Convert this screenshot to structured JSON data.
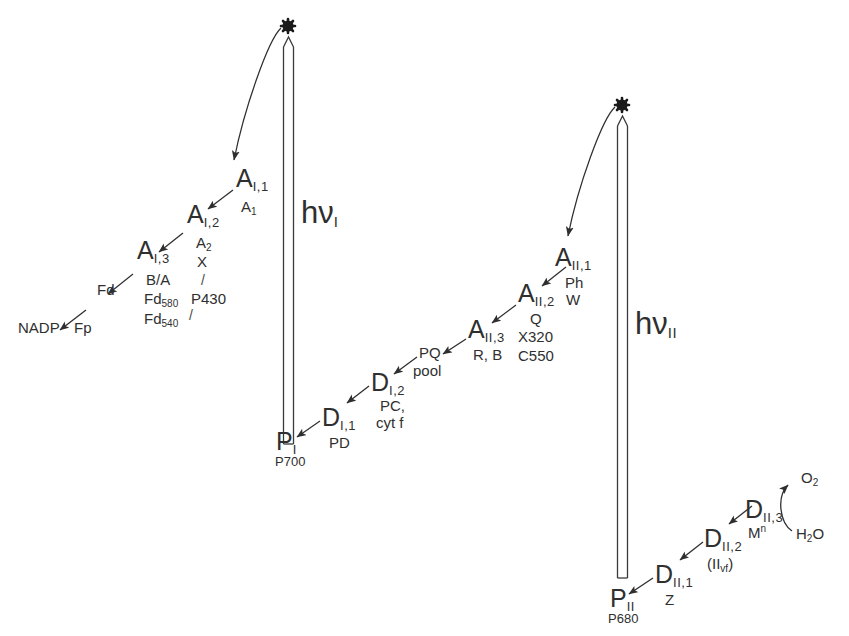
{
  "diagram": {
    "background": "#ffffff",
    "ink": "#2f2f2f"
  },
  "photosystem_I": {
    "photon_label": "hν",
    "photon_subscript": "I",
    "excited_state_marker": "✻",
    "reaction_center": {
      "symbol": "P",
      "subscript": "I",
      "alias": "P700"
    },
    "acceptors": [
      {
        "symbol": "A",
        "subscript": "I,1",
        "aliases": [
          "A₁"
        ]
      },
      {
        "symbol": "A",
        "subscript": "I,2",
        "aliases": [
          "A₂",
          "X",
          "/",
          "P430"
        ]
      },
      {
        "symbol": "A",
        "subscript": "I,3",
        "aliases": [
          "B/A",
          "Fd₅₈₀",
          "Fd₅₄₀"
        ]
      }
    ],
    "acceptor_alias_column1": [
      "A₂",
      "X",
      "B/A",
      "Fd₅₈₀",
      "Fd₅₄₀"
    ],
    "acceptor_alias_column2": [
      "A₁",
      "/",
      "P430"
    ],
    "terminal_carriers": [
      {
        "label": "Fd"
      },
      {
        "label": "Fp"
      },
      {
        "label": "NADP"
      }
    ],
    "donors": [
      {
        "symbol": "D",
        "subscript": "I,1",
        "aliases": [
          "PD"
        ]
      },
      {
        "symbol": "D",
        "subscript": "I,2",
        "aliases": [
          "PC,",
          "cyt f"
        ]
      }
    ]
  },
  "photosystem_II": {
    "photon_label": "hν",
    "photon_subscript": "II",
    "excited_state_marker": "✻",
    "reaction_center": {
      "symbol": "P",
      "subscript": "II",
      "alias": "P680"
    },
    "acceptors": [
      {
        "symbol": "A",
        "subscript": "II,1",
        "aliases": [
          "Ph",
          "W"
        ]
      },
      {
        "symbol": "A",
        "subscript": "II,2",
        "aliases": [
          "Q",
          "X320",
          "C550"
        ]
      },
      {
        "symbol": "A",
        "subscript": "II,3",
        "aliases": [
          "R, B"
        ]
      }
    ],
    "pool": {
      "line1": "PQ",
      "line2": "pool"
    },
    "donors": [
      {
        "symbol": "D",
        "subscript": "II,1",
        "aliases": [
          "Z"
        ]
      },
      {
        "symbol": "D",
        "subscript": "II,2",
        "aliases": [
          "(II_vf)"
        ]
      },
      {
        "symbol": "D",
        "subscript": "II,3",
        "aliases": [
          "Mⁿ"
        ]
      }
    ],
    "water_splitting": {
      "substrate": "H₂O",
      "product": "O₂"
    }
  },
  "labels": {
    "A_I_1": "A",
    "A_I_1_sub": "I,1",
    "A_I_1_alias": "A",
    "A_I_1_alias_sub": "1",
    "A_I_2": "A",
    "A_I_2_sub": "I,2",
    "A_I_3": "A",
    "A_I_3_sub": "I,3",
    "alias_A2": "A",
    "alias_A2_sub": "2",
    "alias_X": "X",
    "alias_BA": "B/A",
    "alias_Fd580": "Fd",
    "alias_Fd580_sub": "580",
    "alias_Fd540": "Fd",
    "alias_Fd540_sub": "540",
    "alias_P430": "P430",
    "slash1": "/",
    "slash2": "/",
    "Fd": "Fd",
    "Fp": "Fp",
    "NADP": "NADP",
    "P_I": "P",
    "P_I_sub": "I",
    "P_I_alias": "P700",
    "D_I_1": "D",
    "D_I_1_sub": "I,1",
    "D_I_1_alias": "PD",
    "D_I_2": "D",
    "D_I_2_sub": "I,2",
    "D_I_2_alias1": "PC,",
    "D_I_2_alias2": "cyt f",
    "PQ": "PQ",
    "pool": "pool",
    "A_II_3": "A",
    "A_II_3_sub": "II,3",
    "A_II_3_alias": "R, B",
    "A_II_2": "A",
    "A_II_2_sub": "II,2",
    "alias_Q": "Q",
    "alias_X320": "X320",
    "alias_C550": "C550",
    "A_II_1": "A",
    "A_II_1_sub": "II,1",
    "alias_Ph": "Ph",
    "alias_W": "W",
    "hv_I": "hν",
    "hv_I_sub": "I",
    "hv_II": "hν",
    "hv_II_sub": "II",
    "star_I": "✻",
    "star_II": "✻",
    "P_II": "P",
    "P_II_sub": "II",
    "P_II_alias": "P680",
    "D_II_1": "D",
    "D_II_1_sub": "II,1",
    "D_II_1_alias": "Z",
    "D_II_2": "D",
    "D_II_2_sub": "II,2",
    "D_II_2_alias": "(II",
    "D_II_2_alias_sub": "vf",
    "D_II_2_alias_end": ")",
    "D_II_3": "D",
    "D_II_3_sub": "II,3",
    "D_II_3_alias": "M",
    "D_II_3_alias_sup": "n",
    "O2": "O",
    "O2_sub": "2",
    "H2O": "H",
    "H2O_sub": "2",
    "H2O_end": "O"
  }
}
